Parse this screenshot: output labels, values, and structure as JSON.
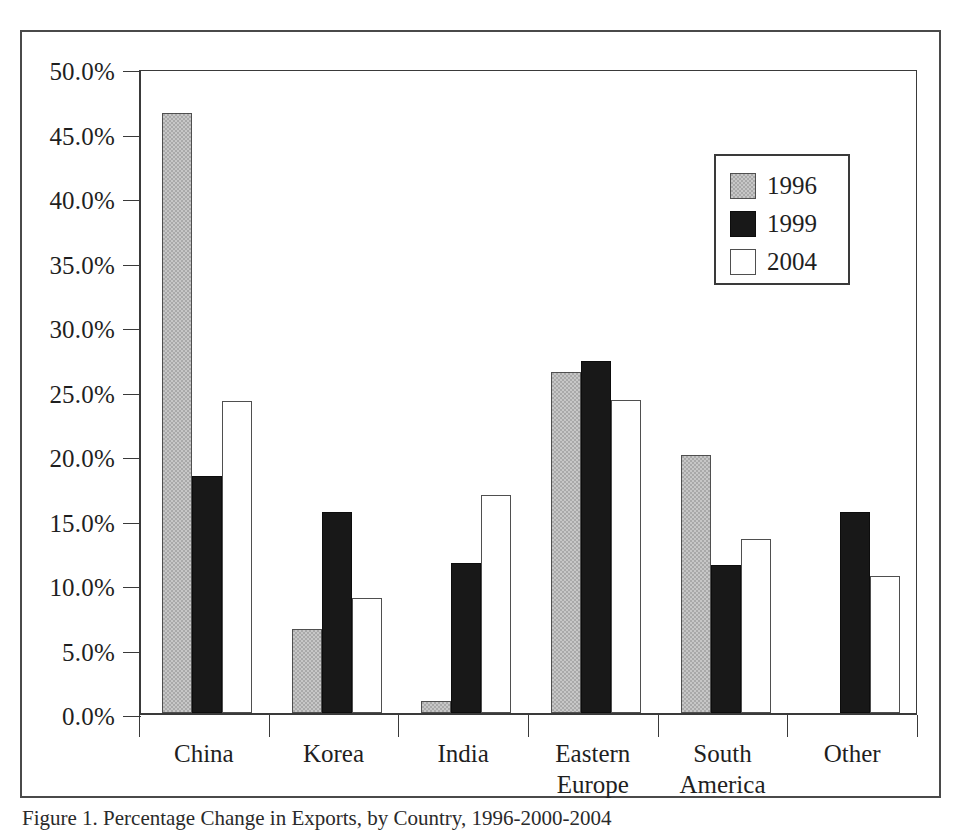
{
  "figure": {
    "caption": "Figure 1. Percentage Change in Exports, by Country, 1996-2000-2004"
  },
  "chart_data": {
    "type": "bar",
    "title": "",
    "subtitle": "",
    "xlabel": "",
    "ylabel": "",
    "categories": [
      "China",
      "Korea",
      "India",
      "Eastern\nEurope",
      "South\nAmerica",
      "Other"
    ],
    "series": [
      {
        "name": "1996",
        "color": "#a9a9a9",
        "values": [
          46.5,
          6.5,
          0.9,
          26.4,
          20.0,
          null
        ]
      },
      {
        "name": "1999",
        "color": "#181818",
        "values": [
          18.4,
          15.6,
          11.6,
          27.3,
          11.5,
          15.6
        ]
      },
      {
        "name": "2004",
        "color": "#ffffff",
        "values": [
          24.2,
          8.9,
          16.9,
          24.3,
          13.5,
          10.6
        ]
      }
    ],
    "ylim": [
      0,
      50
    ],
    "ytick_step": 5,
    "ytick_labels": [
      "0.0%",
      "5.0%",
      "10.0%",
      "15.0%",
      "20.0%",
      "25.0%",
      "30.0%",
      "35.0%",
      "40.0%",
      "45.0%",
      "50.0%"
    ],
    "ytick_values": [
      0,
      5,
      10,
      15,
      20,
      25,
      30,
      35,
      40,
      45,
      50
    ],
    "grid": false,
    "legend": {
      "position": "top-right",
      "entries": [
        "1996",
        "1999",
        "2004"
      ]
    },
    "value_suffix": "%"
  }
}
